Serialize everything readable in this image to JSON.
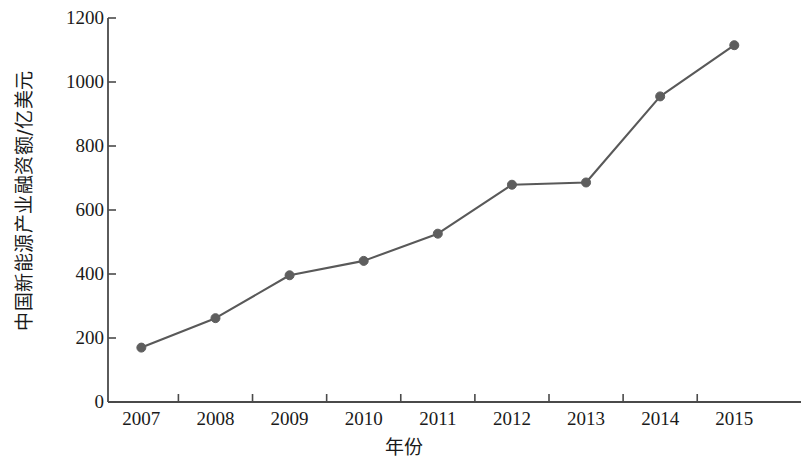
{
  "chart_data": {
    "type": "line",
    "title": "",
    "xlabel": "年份",
    "ylabel": "中国新能源产业融资额/亿美元",
    "categories": [
      "2007",
      "2008",
      "2009",
      "2010",
      "2011",
      "2012",
      "2013",
      "2014",
      "2015"
    ],
    "x": [
      2007,
      2008,
      2009,
      2010,
      2011,
      2012,
      2013,
      2014,
      2015
    ],
    "values": [
      170,
      262,
      396,
      441,
      526,
      679,
      686,
      955,
      1115
    ],
    "series": [
      {
        "name": "中国新能源产业融资额",
        "values": [
          170,
          262,
          396,
          441,
          526,
          679,
          686,
          955,
          1115
        ]
      }
    ],
    "ylim": [
      0,
      1200
    ],
    "yticks": [
      0,
      200,
      400,
      600,
      800,
      1000,
      1200
    ],
    "ytick_labels": [
      "0",
      "200",
      "400",
      "600",
      "800",
      "1000",
      "1200"
    ],
    "xlim": [
      2006.55,
      2015.9
    ],
    "grid": false,
    "legend": false,
    "legend_position": "none",
    "marker": "circle",
    "marker_size": 9,
    "line_color": "#595959",
    "marker_color": "#5e5e5e",
    "axis_color": "#4a4a4a",
    "background_color": "#ffffff"
  },
  "axes": {
    "y_title": "中国新能源产业融资额/亿美元",
    "x_title": "年份"
  }
}
